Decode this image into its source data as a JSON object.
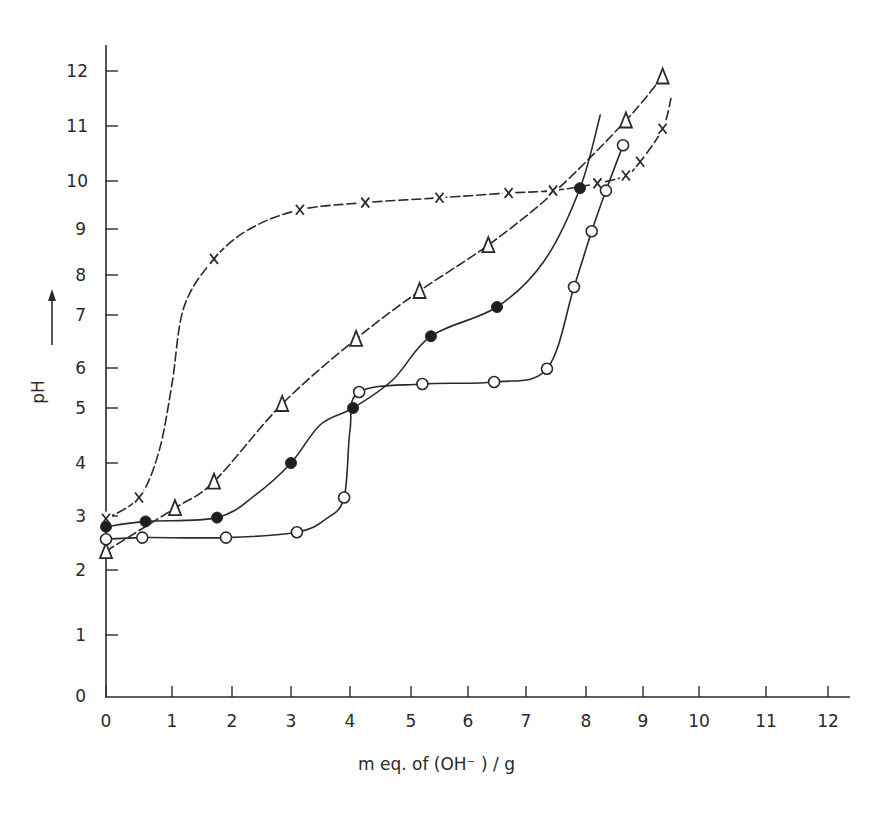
{
  "chart_data": {
    "type": "line",
    "title": "",
    "xlabel": "m eq. of (OH⁻) / g",
    "ylabel": "pH",
    "ylabel_arrow": "up-arrow",
    "xlim": [
      0,
      12
    ],
    "ylim": [
      0,
      12
    ],
    "grid": false,
    "legend": "none (series distinguished by marker: x, open triangle, filled circle, open circle)",
    "x_ticks": [
      0,
      1,
      2,
      3,
      4,
      5,
      6,
      7,
      8,
      9,
      10,
      11,
      12
    ],
    "y_ticks": [
      0,
      1,
      2,
      3,
      4,
      5,
      6,
      7,
      8,
      9,
      10,
      11,
      12
    ],
    "series": [
      {
        "name": "cross",
        "marker": "x",
        "x": [
          0,
          0.5,
          1.7,
          3.15,
          4.25,
          5.5,
          6.7,
          7.45,
          8.2,
          8.7,
          8.95,
          9.35
        ],
        "y": [
          2.95,
          3.35,
          8.35,
          9.4,
          9.55,
          9.65,
          9.75,
          9.8,
          9.95,
          10.1,
          10.35,
          10.95
        ],
        "curve_x": [
          0,
          0.5,
          0.8,
          1.0,
          1.2,
          1.7,
          2.3,
          3.15,
          4.25,
          5.5,
          6.7,
          7.45,
          8.2,
          8.7,
          8.95,
          9.35,
          9.5
        ],
        "curve_y": [
          2.95,
          3.35,
          4.2,
          5.6,
          7.2,
          8.35,
          9.0,
          9.4,
          9.55,
          9.65,
          9.75,
          9.8,
          9.95,
          10.1,
          10.35,
          10.95,
          11.5
        ]
      },
      {
        "name": "triangle",
        "marker": "open-triangle",
        "x": [
          0,
          1.05,
          1.7,
          2.85,
          4.1,
          5.15,
          6.35,
          8.7,
          9.35
        ],
        "y": [
          2.35,
          3.15,
          3.65,
          5.1,
          6.55,
          7.6,
          8.65,
          11.1,
          11.9
        ],
        "curve_x": [
          0,
          1.05,
          1.7,
          2.85,
          4.1,
          5.15,
          6.35,
          7.5,
          8.7,
          9.35
        ],
        "curve_y": [
          2.35,
          3.15,
          3.65,
          5.1,
          6.55,
          7.6,
          8.65,
          9.8,
          11.1,
          11.9
        ]
      },
      {
        "name": "filled-circle",
        "marker": "filled-circle",
        "x": [
          0,
          0.6,
          1.75,
          3.0,
          4.05,
          5.35,
          6.5,
          7.9
        ],
        "y": [
          2.8,
          2.9,
          2.97,
          4.0,
          5.0,
          6.6,
          7.2,
          9.85
        ],
        "curve_x": [
          0,
          0.6,
          1.75,
          2.4,
          3.0,
          3.5,
          4.05,
          4.7,
          5.35,
          6.5,
          7.3,
          7.9,
          8.25
        ],
        "curve_y": [
          2.8,
          2.9,
          2.97,
          3.4,
          4.0,
          4.7,
          5.0,
          5.7,
          6.6,
          7.2,
          8.3,
          9.85,
          11.2
        ]
      },
      {
        "name": "open-circle",
        "marker": "open-circle",
        "x": [
          0,
          0.55,
          1.9,
          3.1,
          3.9,
          4.15,
          5.2,
          6.45,
          7.35,
          7.8,
          8.1,
          8.35,
          8.65
        ],
        "y": [
          2.57,
          2.6,
          2.6,
          2.7,
          3.35,
          5.4,
          5.6,
          5.65,
          5.98,
          7.7,
          8.95,
          9.8,
          10.65
        ],
        "curve_x": [
          0,
          0.55,
          1.9,
          3.1,
          3.6,
          3.9,
          4.0,
          4.15,
          5.2,
          6.45,
          7.35,
          7.8,
          8.1,
          8.35,
          8.65
        ],
        "curve_y": [
          2.57,
          2.6,
          2.6,
          2.7,
          2.95,
          3.35,
          4.6,
          5.4,
          5.6,
          5.65,
          5.98,
          7.7,
          8.95,
          9.8,
          10.65
        ]
      }
    ]
  },
  "axes": {
    "x_tick_labels": [
      "0",
      "1",
      "2",
      "3",
      "4",
      "5",
      "6",
      "7",
      "8",
      "9",
      "10",
      "11",
      "12"
    ],
    "y_tick_labels": [
      "0",
      "1",
      "2",
      "3",
      "4",
      "5",
      "6",
      "7",
      "8",
      "9",
      "10",
      "11",
      "12"
    ],
    "x_title": "m  eq. of  (OH⁻ ) / g",
    "y_title": "pH"
  }
}
